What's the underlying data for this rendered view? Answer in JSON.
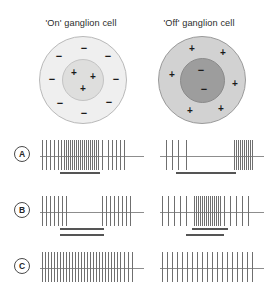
{
  "figure": {
    "background_color": "#ffffff",
    "columns": [
      {
        "key": "on",
        "title": "'On' ganglion cell"
      },
      {
        "key": "off",
        "title": "'Off' ganglion cell"
      }
    ]
  },
  "cells": {
    "on": {
      "name": "on-center-receptive-field",
      "surround_fill": "#efefef",
      "center_fill": "#dededd",
      "center_signs": [
        "+",
        "+",
        "+"
      ],
      "surround_signs": [
        "−",
        "−",
        "−",
        "−",
        "−",
        "−",
        "−",
        "−"
      ],
      "center_sign_type": "plus",
      "surround_sign_type": "minus",
      "center_positions": [
        {
          "x": 34,
          "y": 36
        },
        {
          "x": 53,
          "y": 40
        },
        {
          "x": 43,
          "y": 52
        }
      ],
      "surround_positions": [
        {
          "x": 44,
          "y": 11
        },
        {
          "x": 68,
          "y": 19
        },
        {
          "x": 76,
          "y": 42
        },
        {
          "x": 69,
          "y": 65
        },
        {
          "x": 44,
          "y": 76
        },
        {
          "x": 20,
          "y": 66
        },
        {
          "x": 12,
          "y": 42
        },
        {
          "x": 19,
          "y": 19
        }
      ]
    },
    "off": {
      "name": "off-center-receptive-field",
      "surround_fill": "#d2d2d2",
      "center_fill": "#9d9d9d",
      "center_signs": [
        "−",
        "−"
      ],
      "surround_signs": [
        "+",
        "+",
        "+",
        "+",
        "+",
        "+"
      ],
      "center_sign_type": "minus",
      "surround_sign_type": "plus",
      "center_positions": [
        {
          "x": 42,
          "y": 33
        },
        {
          "x": 45,
          "y": 52
        }
      ],
      "surround_positions": [
        {
          "x": 33,
          "y": 12
        },
        {
          "x": 64,
          "y": 16
        },
        {
          "x": 76,
          "y": 47
        },
        {
          "x": 62,
          "y": 72
        },
        {
          "x": 31,
          "y": 74
        },
        {
          "x": 13,
          "y": 38
        }
      ]
    }
  },
  "responses": {
    "rows": [
      {
        "label": "A",
        "name": "row-a",
        "stimulus_description": "central spot",
        "on": {
          "stim_bar": {
            "start": 20,
            "width": 40,
            "y": 36
          },
          "spikes": [
            2,
            6,
            10,
            14,
            18,
            21,
            24,
            26,
            28,
            30,
            32,
            34,
            36,
            38,
            40,
            42,
            44,
            46,
            48,
            50,
            52,
            54,
            56,
            58,
            62,
            68,
            72,
            76,
            80,
            84
          ]
        },
        "off": {
          "stim_bar": {
            "start": 16,
            "width": 60,
            "y": 36
          },
          "spikes": [
            6,
            12,
            18,
            26,
            74,
            76,
            78,
            80,
            82,
            84,
            86,
            88,
            90,
            92
          ]
        }
      },
      {
        "label": "B",
        "name": "row-b",
        "stimulus_description": "annular surround",
        "on": {
          "stim_bar": {
            "start": 20,
            "width": 44,
            "y": 36
          },
          "spikes": [
            2,
            6,
            10,
            14,
            18,
            22,
            26,
            62,
            66,
            70,
            74,
            78,
            82,
            86,
            90
          ]
        },
        "off": {
          "stim_bar": {
            "start": 32,
            "width": 36,
            "y": 36
          },
          "spikes": [
            2,
            8,
            14,
            20,
            26,
            34,
            36,
            38,
            40,
            42,
            44,
            46,
            48,
            50,
            52,
            54,
            56,
            58,
            60,
            64,
            70,
            76,
            82,
            88
          ]
        }
      },
      {
        "label": "C",
        "name": "row-c",
        "stimulus_description": "diffuse illumination",
        "on": {
          "stim_bar": {
            "start": 20,
            "width": 44,
            "y": -14
          },
          "spikes": [
            2,
            5,
            8,
            11,
            14,
            17,
            20,
            23,
            26,
            29,
            32,
            35,
            38,
            41,
            44,
            47,
            50,
            53,
            56,
            59,
            62,
            65,
            68,
            71,
            74,
            77,
            80,
            84,
            88,
            92
          ]
        },
        "off": {
          "stim_bar": {
            "start": 26,
            "width": 38,
            "y": -14
          },
          "spikes": [
            2,
            7,
            12,
            17,
            22,
            27,
            32,
            37,
            42,
            47,
            52,
            57,
            62,
            67,
            72,
            77,
            82,
            87,
            92
          ]
        }
      }
    ],
    "row_tops": [
      136,
      192,
      248
    ]
  },
  "colors": {
    "spike": "#6f6f6f",
    "baseline": "#8d8d8d",
    "stim_bar": "#555555",
    "text": "#2b2b2b"
  }
}
